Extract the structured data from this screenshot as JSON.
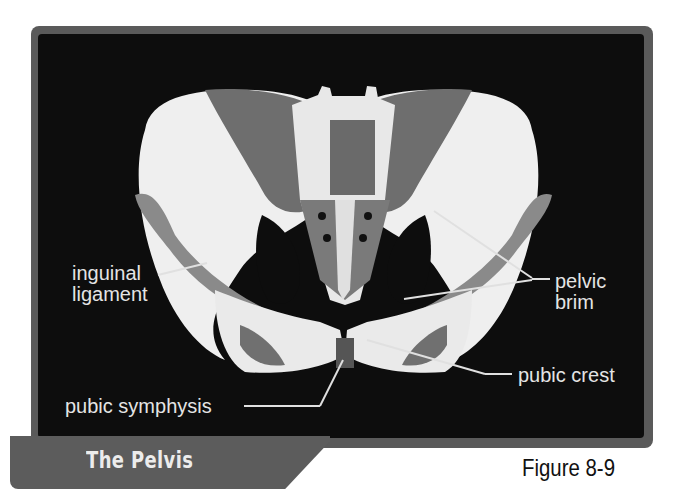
{
  "figure": {
    "title": "The Pelvis",
    "number": "Figure 8-9",
    "image_alt": "Anterior view of the pelvis with muscles highlighted"
  },
  "labels": {
    "inguinal_ligament": [
      "inguinal",
      "ligament"
    ],
    "pelvic_brim": [
      "pelvic",
      "brim"
    ],
    "pubic_crest": "pubic crest",
    "pubic_symphysis": "pubic symphysis"
  },
  "colors": {
    "frame": "#5a5a5a",
    "panel": "#0d0d0d",
    "bone": "#f2f2f2",
    "muscle": "#707070",
    "label_text": "#e4e4e4",
    "leader_line": "#e0e0e0"
  }
}
